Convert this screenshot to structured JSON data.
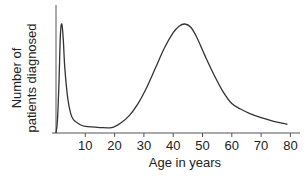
{
  "chart_data": {
    "type": "line",
    "title": "",
    "xlabel": "Age in years",
    "ylabel": "Number of patients diagnosed",
    "x_ticks": [
      10,
      20,
      30,
      40,
      50,
      60,
      70,
      80
    ],
    "xlim": [
      0,
      82
    ],
    "y_ticks": [],
    "grid": false,
    "legend": null,
    "series": [
      {
        "name": "Patients diagnosed",
        "x": [
          0,
          0.5,
          1,
          1.5,
          2,
          2.5,
          3,
          4,
          5,
          6,
          8,
          10,
          15,
          19,
          22,
          25,
          28,
          31,
          34,
          37,
          40,
          42,
          44,
          46,
          48,
          51,
          54,
          57,
          60,
          63,
          66,
          70,
          74,
          79
        ],
        "values": [
          0,
          12,
          45,
          90,
          100,
          85,
          60,
          32,
          18,
          12,
          8,
          6,
          5,
          5,
          9,
          16,
          27,
          42,
          60,
          78,
          92,
          98,
          100,
          97,
          88,
          70,
          53,
          38,
          27,
          22,
          18,
          14,
          11,
          8
        ]
      }
    ],
    "annotations": [
      "Sharp peak near age 2",
      "Broad peak near age 44"
    ]
  },
  "axis": {
    "x_label": "Age in years",
    "y_label_line1": "Number of",
    "y_label_line2": "patients diagnosed",
    "ticks": [
      "10",
      "20",
      "30",
      "40",
      "50",
      "60",
      "70",
      "80"
    ]
  }
}
